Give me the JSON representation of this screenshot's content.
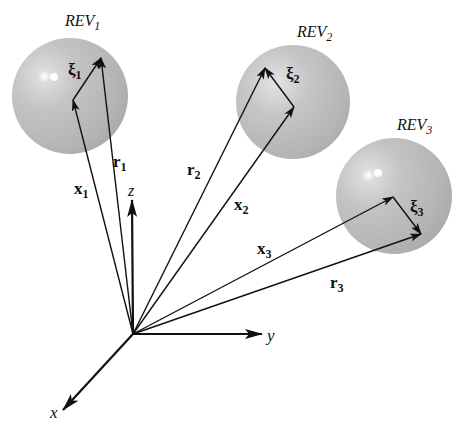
{
  "diagram": {
    "origin": {
      "x": 133,
      "y": 334
    },
    "axes": [
      {
        "id": "z",
        "label": "z",
        "tip": {
          "x": 132,
          "y": 200
        },
        "label_pos": {
          "x": 128,
          "y": 196
        }
      },
      {
        "id": "y",
        "label": "y",
        "tip": {
          "x": 262,
          "y": 334
        },
        "label_pos": {
          "x": 267,
          "y": 341
        }
      },
      {
        "id": "x",
        "label": "x",
        "tip": {
          "x": 63,
          "y": 410
        },
        "label_pos": {
          "x": 50,
          "y": 418
        }
      }
    ],
    "spheres": [
      {
        "id": "rev1",
        "label": "REV",
        "label_sub": "1",
        "label_pos": {
          "x": 65,
          "y": 26
        },
        "center": {
          "x": 70,
          "y": 96
        },
        "radius": 58,
        "highlight": {
          "x": 54,
          "y": 77
        },
        "x_vector": {
          "label": "x",
          "sub": "1",
          "tip": {
            "x": 73,
            "y": 100
          },
          "label_pos": {
            "x": 74,
            "y": 194
          }
        },
        "r_vector": {
          "label": "r",
          "sub": "1",
          "tip": {
            "x": 101,
            "y": 58
          },
          "label_pos": {
            "x": 113,
            "y": 167
          }
        },
        "xi_vector": {
          "label": "ξ",
          "sub": "1",
          "label_pos": {
            "x": 68,
            "y": 75
          }
        }
      },
      {
        "id": "rev2",
        "label": "REV",
        "label_sub": "2",
        "label_pos": {
          "x": 297,
          "y": 37
        },
        "center": {
          "x": 293,
          "y": 102
        },
        "radius": 57,
        "highlight": {
          "x": 276,
          "y": 83
        },
        "x_vector": {
          "label": "x",
          "sub": "2",
          "tip": {
            "x": 294,
            "y": 107
          },
          "label_pos": {
            "x": 234,
            "y": 210
          }
        },
        "r_vector": {
          "label": "r",
          "sub": "2",
          "tip": {
            "x": 265,
            "y": 68
          },
          "label_pos": {
            "x": 187,
            "y": 175
          }
        },
        "xi_vector": {
          "label": "ξ",
          "sub": "2",
          "label_pos": {
            "x": 286,
            "y": 79
          }
        }
      },
      {
        "id": "rev3",
        "label": "REV",
        "label_sub": "3",
        "label_pos": {
          "x": 397,
          "y": 130
        },
        "center": {
          "x": 394,
          "y": 196
        },
        "radius": 58,
        "highlight": {
          "x": 378,
          "y": 173
        },
        "x_vector": {
          "label": "x",
          "sub": "3",
          "tip": {
            "x": 393,
            "y": 197
          },
          "label_pos": {
            "x": 257,
            "y": 254
          }
        },
        "r_vector": {
          "label": "r",
          "sub": "3",
          "tip": {
            "x": 421,
            "y": 234
          },
          "label_pos": {
            "x": 330,
            "y": 288
          }
        },
        "xi_vector": {
          "label": "ξ",
          "sub": "3",
          "label_pos": {
            "x": 410,
            "y": 212
          }
        }
      }
    ],
    "colors": {
      "sphere_fill": "#b9b9b9",
      "sphere_edge": "#a8a8a8",
      "highlight": "#ffffff",
      "line": "#111111",
      "background": "#ffffff"
    }
  }
}
